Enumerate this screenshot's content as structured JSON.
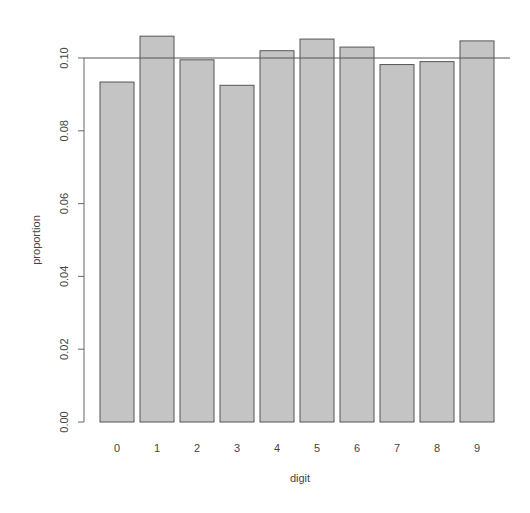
{
  "chart_data": {
    "type": "bar",
    "title": "",
    "xlabel": "digit",
    "ylabel": "proportion",
    "categories": [
      "0",
      "1",
      "2",
      "3",
      "4",
      "5",
      "6",
      "7",
      "8",
      "9"
    ],
    "values": [
      0.0934,
      0.106,
      0.0995,
      0.0925,
      0.102,
      0.1052,
      0.103,
      0.0982,
      0.099,
      0.1047
    ],
    "ylim": [
      0,
      0.1
    ],
    "yticks": [
      "0.00",
      "0.02",
      "0.04",
      "0.06",
      "0.08",
      "0.10"
    ],
    "ytick_values": [
      0,
      0.02,
      0.04,
      0.06,
      0.08,
      0.1
    ],
    "reference_line": {
      "y": 0.1,
      "orientation": "horizontal"
    },
    "grid": false,
    "legend": null,
    "colors": {
      "bar_fill": "#c4c4c4",
      "bar_stroke": "#555555",
      "axis": "#666666",
      "reference_line": "#555555"
    }
  }
}
